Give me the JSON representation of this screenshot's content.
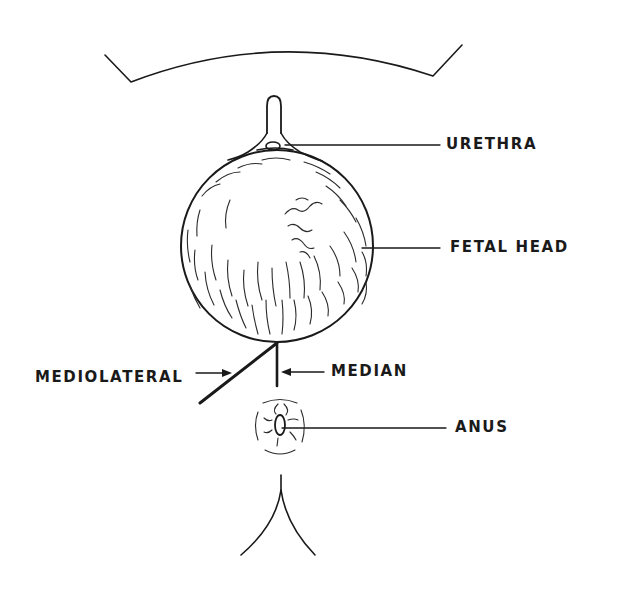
{
  "figure": {
    "ink_color": "#1a1a1a",
    "background": "#ffffff"
  },
  "labels": {
    "urethra": "URETHRA",
    "fetal_head": "FETAL HEAD",
    "mediolateral": "MEDIOLATERAL",
    "median": "MEDIAN",
    "anus": "ANUS"
  },
  "structures": [
    {
      "id": "symphysis-arc",
      "description": "pubic arch outline"
    },
    {
      "id": "clitoris",
      "description": "clitoral hood stalk"
    },
    {
      "id": "urethra",
      "description": "urethral opening"
    },
    {
      "id": "fetal-head",
      "description": "crowning fetal head with hair"
    },
    {
      "id": "mediolateral-incision",
      "description": "oblique incision line"
    },
    {
      "id": "median-incision",
      "description": "vertical midline incision"
    },
    {
      "id": "anus",
      "description": "anal opening with sphincter folds"
    },
    {
      "id": "gluteal-cleft",
      "description": "buttocks outline"
    }
  ]
}
